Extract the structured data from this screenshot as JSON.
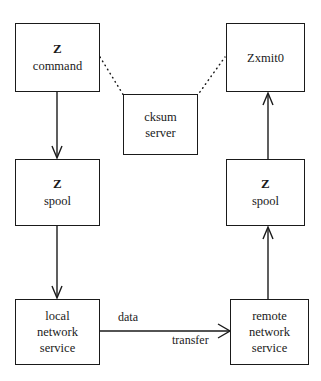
{
  "diagram": {
    "canvas": {
      "width": 321,
      "height": 381
    },
    "stroke_color": "#1a1a1a",
    "background_color": "#ffffff",
    "nodes": [
      {
        "id": "z-command",
        "name": "z-command-box",
        "lines": [
          {
            "text": "Z",
            "bold": true
          },
          {
            "text": "command",
            "bold": false
          }
        ],
        "x": 15,
        "y": 23,
        "width": 85,
        "height": 69
      },
      {
        "id": "zxmit0",
        "name": "zxmit0-box",
        "lines": [
          {
            "text": "Zxmit0",
            "bold": false
          }
        ],
        "x": 226,
        "y": 23,
        "width": 79,
        "height": 69
      },
      {
        "id": "cksum-server",
        "name": "cksum-server-box",
        "lines": [
          {
            "text": "cksum",
            "bold": false
          },
          {
            "text": "server",
            "bold": false
          }
        ],
        "x": 123,
        "y": 94,
        "width": 75,
        "height": 61
      },
      {
        "id": "z-spool-local",
        "name": "z-spool-local-box",
        "lines": [
          {
            "text": "Z",
            "bold": true
          },
          {
            "text": "spool",
            "bold": false
          }
        ],
        "x": 15,
        "y": 159,
        "width": 85,
        "height": 67
      },
      {
        "id": "z-spool-remote",
        "name": "z-spool-remote-box",
        "lines": [
          {
            "text": "Z",
            "bold": true
          },
          {
            "text": "spool",
            "bold": false
          }
        ],
        "x": 226,
        "y": 159,
        "width": 79,
        "height": 67
      },
      {
        "id": "local-network-service",
        "name": "local-network-service-box",
        "lines": [
          {
            "text": "local",
            "bold": false
          },
          {
            "text": "network",
            "bold": false
          },
          {
            "text": "service",
            "bold": false
          }
        ],
        "x": 15,
        "y": 299,
        "width": 85,
        "height": 66
      },
      {
        "id": "remote-network-service",
        "name": "remote-network-service-box",
        "lines": [
          {
            "text": "remote",
            "bold": false
          },
          {
            "text": "network",
            "bold": false
          },
          {
            "text": "service",
            "bold": false
          }
        ],
        "x": 230,
        "y": 299,
        "width": 79,
        "height": 66
      }
    ],
    "edge_labels": [
      {
        "id": "data-label",
        "name": "data-edge-label",
        "text": "data",
        "x": 118,
        "y": 310
      },
      {
        "id": "transfer-label",
        "name": "transfer-edge-label",
        "text": "transfer",
        "x": 172,
        "y": 333
      }
    ],
    "connectors": [
      {
        "id": "z-command-to-z-spool",
        "name": "arrow-z-command-to-z-spool",
        "style": "solid",
        "arrow": "down"
      },
      {
        "id": "z-spool-to-local-service",
        "name": "arrow-z-spool-to-local-network-service",
        "style": "solid",
        "arrow": "down"
      },
      {
        "id": "local-service-to-remote-service",
        "name": "arrow-local-network-service-to-remote-network-service",
        "style": "solid",
        "arrow": "right"
      },
      {
        "id": "remote-service-to-z-spool",
        "name": "arrow-remote-network-service-to-z-spool",
        "style": "solid",
        "arrow": "up"
      },
      {
        "id": "z-spool-to-zxmit0",
        "name": "arrow-z-spool-to-zxmit0",
        "style": "solid",
        "arrow": "up"
      },
      {
        "id": "z-command-to-cksum",
        "name": "dotted-link-z-command-to-cksum-server",
        "style": "dotted",
        "arrow": "none"
      },
      {
        "id": "cksum-to-zxmit0",
        "name": "dotted-link-cksum-server-to-zxmit0",
        "style": "dotted",
        "arrow": "none"
      }
    ]
  }
}
